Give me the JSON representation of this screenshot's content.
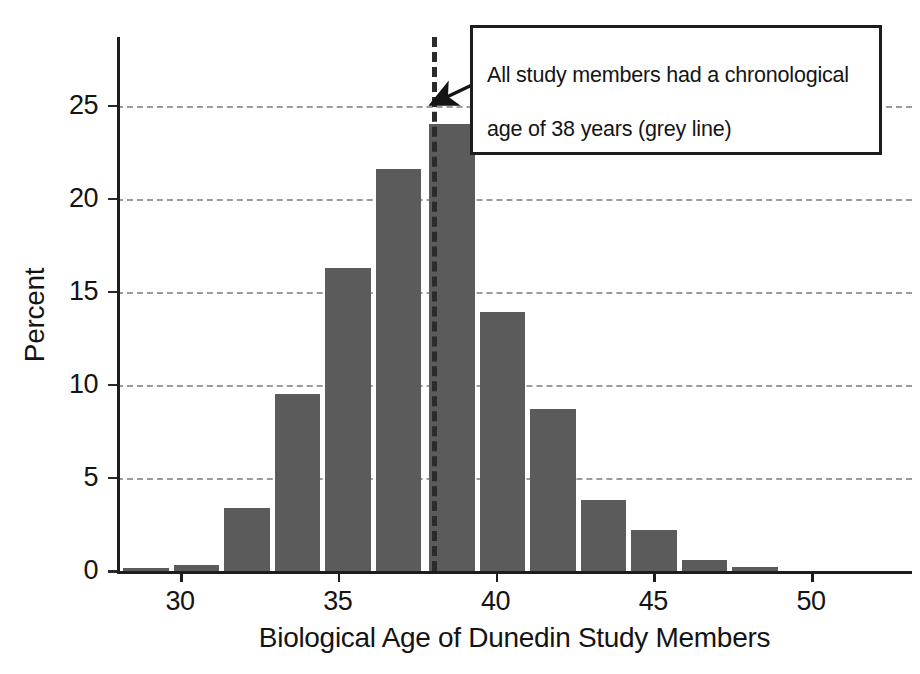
{
  "chart_data": {
    "type": "bar",
    "title": "",
    "xlabel": "Biological Age of Dunedin Study Members",
    "ylabel": "Percent",
    "xlim": [
      28.0,
      53.2
    ],
    "ylim": [
      0,
      28.7
    ],
    "xticks": [
      30,
      35,
      40,
      45,
      50
    ],
    "yticks": [
      0,
      5,
      10,
      15,
      20,
      25
    ],
    "grid": "horizontal-dashed",
    "legend": "none",
    "bar_color": "#5b5b5b",
    "bin_width": 1.6,
    "categories": [
      29.0,
      30.6,
      32.2,
      33.8,
      35.4,
      37.0,
      38.7,
      40.3,
      41.9,
      43.5,
      45.1,
      46.7,
      48.3
    ],
    "values": [
      0.15,
      0.35,
      3.4,
      9.5,
      16.3,
      21.6,
      24.0,
      13.9,
      8.7,
      3.8,
      2.2,
      0.6,
      0.2
    ],
    "reference_line": {
      "x": 38,
      "style": "dashed",
      "color": "#2b2b2b",
      "label": "chronological age 38"
    },
    "annotation": {
      "text": "All study members had a chronological\nage of 38 years (grey line)",
      "points_to_x": 38,
      "points_to_y": 25
    }
  },
  "axis": {
    "y_tick_labels": [
      "25",
      "20",
      "15",
      "10",
      "5",
      "0"
    ],
    "x_tick_labels": [
      "30",
      "35",
      "40",
      "45",
      "50"
    ],
    "y_title": "Percent",
    "x_title": "Biological Age of Dunedin Study Members"
  },
  "annotation": {
    "line1": "All study members had a chronological",
    "line2": "age of 38 years (grey line)"
  }
}
